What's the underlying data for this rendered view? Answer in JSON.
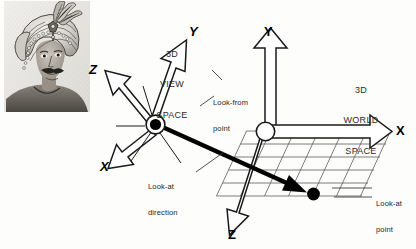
{
  "figure": {
    "background_color": "#fdfdfc",
    "ink_color": "#000000",
    "grid_color": "#555555"
  },
  "view_space": {
    "title_line1": "3D",
    "title_line2": "VIEW",
    "title_line3": "SPACE",
    "axes": [
      {
        "name": "y-axis-view",
        "label": "Y",
        "direction": "up-right"
      },
      {
        "name": "z-axis-view",
        "label": "Z",
        "direction": "up-left"
      },
      {
        "name": "x-axis-view",
        "label": "X",
        "direction": "down-left"
      }
    ],
    "origin_marker": "look-from-point-dot"
  },
  "world_space": {
    "title_line1": "3D",
    "title_line2": "WORLD",
    "title_line3": "SPACE",
    "axes": [
      {
        "name": "y-axis-world",
        "label": "Y",
        "direction": "up"
      },
      {
        "name": "x-axis-world",
        "label": "X",
        "direction": "right"
      },
      {
        "name": "z-axis-world",
        "label": "Z",
        "direction": "down-left"
      }
    ],
    "origin_marker": "world-origin-circle",
    "ground_plane": "perspective grid"
  },
  "callouts": {
    "look_from": {
      "line1": "Look-from",
      "line2": "point"
    },
    "look_at_direction": {
      "line1": "Look-at",
      "line2": "direction"
    },
    "look_at_point": {
      "line1": "Look-at",
      "line2": "point"
    }
  },
  "illustration": {
    "name": "engraved portrait of man wearing ornate turban with feather plume",
    "style": "antique steel engraving, grayscale"
  }
}
